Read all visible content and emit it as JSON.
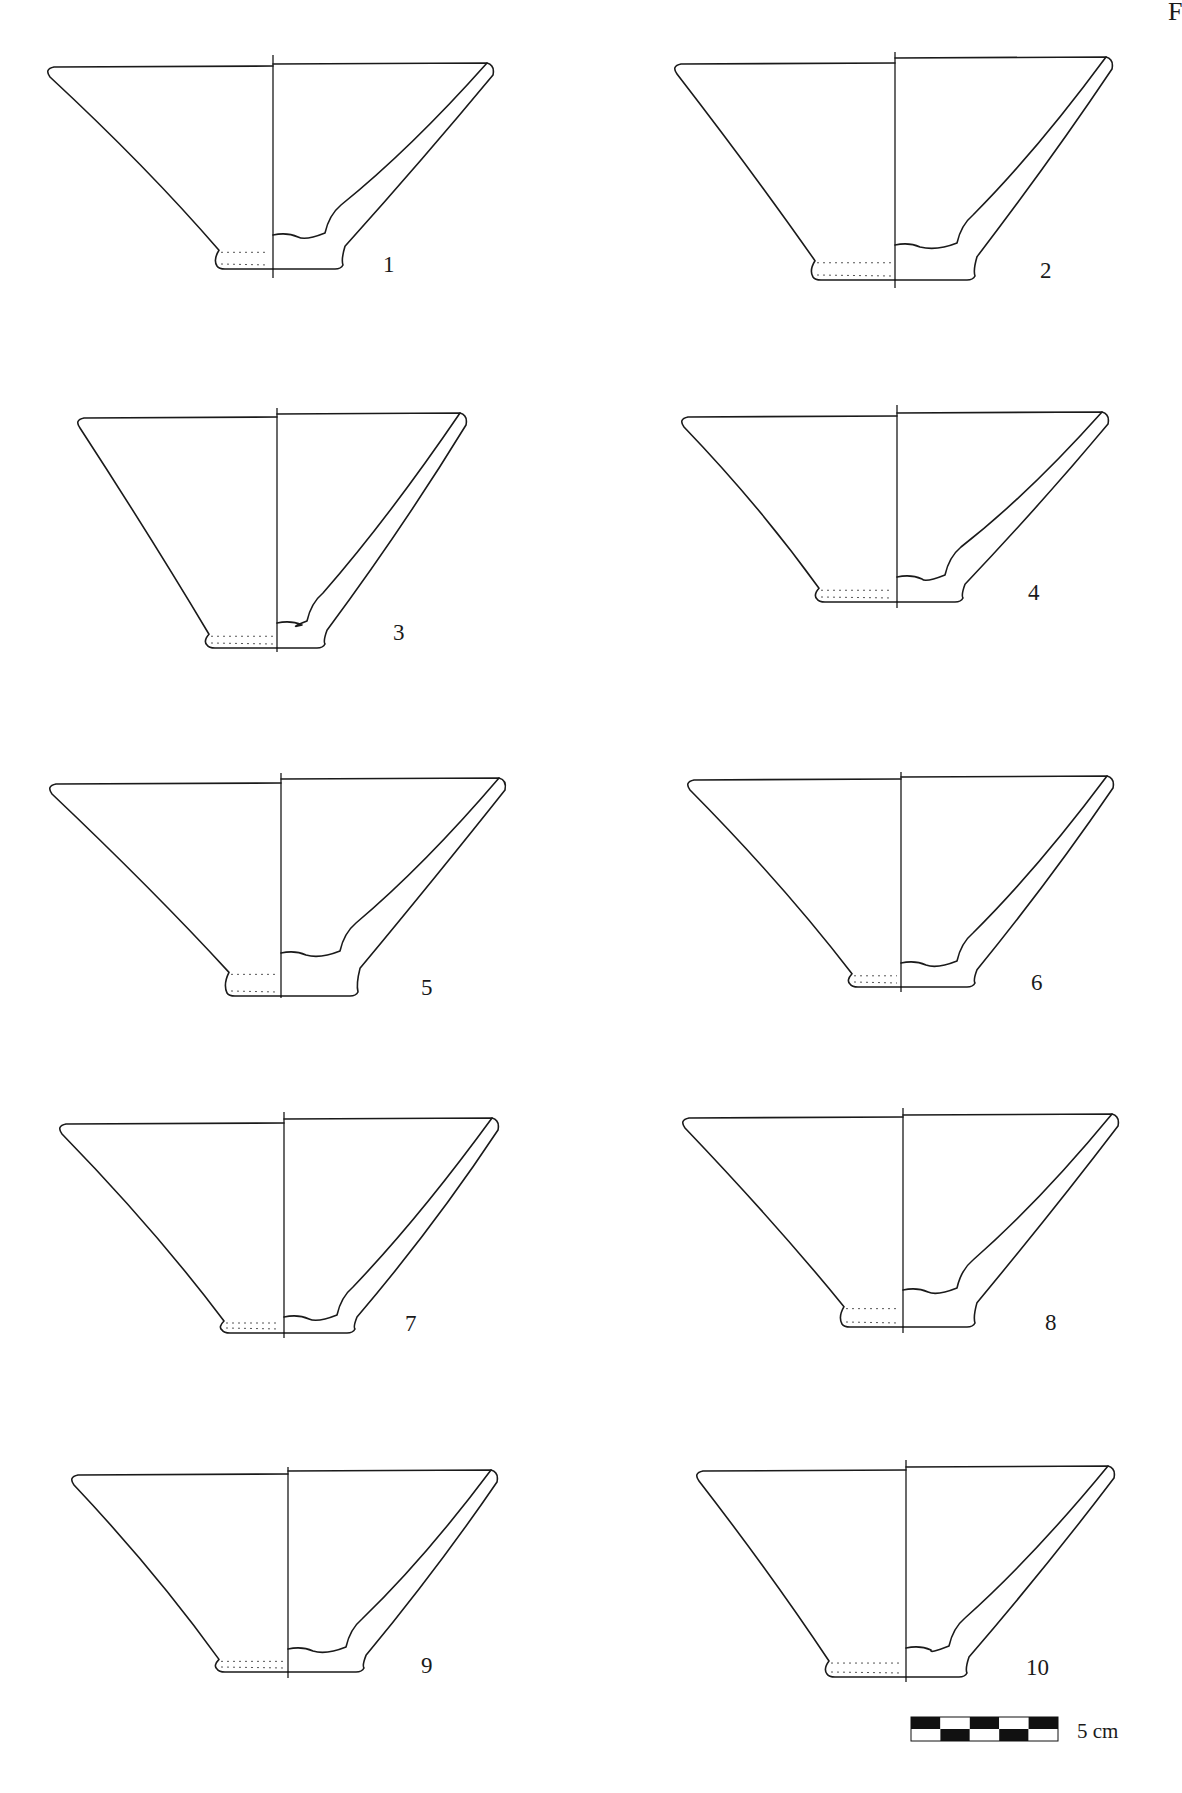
{
  "plate": {
    "page_mark": "F",
    "colors": {
      "ink": "#1a1a1a",
      "paper": "#ffffff"
    }
  },
  "figures": [
    {
      "label": "1",
      "rim_left": [
        48,
        65
      ],
      "rim_right": [
        493,
        63
      ],
      "axis_x": 273,
      "axis_top": 55,
      "axis_bottom": 278,
      "base_y": 269,
      "foot_left": 217,
      "foot_right": 343,
      "interior_y": 235,
      "label_pos": [
        383,
        272
      ]
    },
    {
      "label": "2",
      "rim_left": [
        675,
        62
      ],
      "rim_right": [
        1112,
        57
      ],
      "axis_x": 895,
      "axis_top": 52,
      "axis_bottom": 288,
      "base_y": 280,
      "foot_left": 813,
      "foot_right": 975,
      "interior_y": 245,
      "label_pos": [
        1040,
        278
      ]
    },
    {
      "label": "3",
      "rim_left": [
        78,
        416
      ],
      "rim_right": [
        466,
        413
      ],
      "axis_x": 277,
      "axis_top": 408,
      "axis_bottom": 652,
      "base_y": 648,
      "foot_left": 207,
      "foot_right": 325,
      "interior_y": 623,
      "label_pos": [
        393,
        640
      ]
    },
    {
      "label": "4",
      "rim_left": [
        682,
        415
      ],
      "rim_right": [
        1108,
        412
      ],
      "axis_x": 897,
      "axis_top": 405,
      "axis_bottom": 608,
      "base_y": 602,
      "foot_left": 817,
      "foot_right": 963,
      "interior_y": 577,
      "label_pos": [
        1028,
        600
      ]
    },
    {
      "label": "5",
      "rim_left": [
        50,
        782
      ],
      "rim_right": [
        505,
        778
      ],
      "axis_x": 281,
      "axis_top": 773,
      "axis_bottom": 998,
      "base_y": 996,
      "foot_left": 227,
      "foot_right": 358,
      "interior_y": 953,
      "label_pos": [
        421,
        995
      ]
    },
    {
      "label": "6",
      "rim_left": [
        688,
        778
      ],
      "rim_right": [
        1113,
        776
      ],
      "axis_x": 901,
      "axis_top": 772,
      "axis_bottom": 992,
      "base_y": 987,
      "foot_left": 850,
      "foot_right": 975,
      "interior_y": 963,
      "label_pos": [
        1031,
        990
      ]
    },
    {
      "label": "7",
      "rim_left": [
        60,
        1122
      ],
      "rim_right": [
        498,
        1118
      ],
      "axis_x": 284,
      "axis_top": 1112,
      "axis_bottom": 1338,
      "base_y": 1333,
      "foot_left": 222,
      "foot_right": 355,
      "interior_y": 1317,
      "label_pos": [
        405,
        1331
      ]
    },
    {
      "label": "8",
      "rim_left": [
        683,
        1116
      ],
      "rim_right": [
        1118,
        1114
      ],
      "axis_x": 903,
      "axis_top": 1108,
      "axis_bottom": 1333,
      "base_y": 1327,
      "foot_left": 842,
      "foot_right": 975,
      "interior_y": 1290,
      "label_pos": [
        1045,
        1330
      ]
    },
    {
      "label": "9",
      "rim_left": [
        72,
        1473
      ],
      "rim_right": [
        497,
        1470
      ],
      "axis_x": 288,
      "axis_top": 1467,
      "axis_bottom": 1678,
      "base_y": 1672,
      "foot_left": 217,
      "foot_right": 364,
      "interior_y": 1649,
      "label_pos": [
        421,
        1673
      ]
    },
    {
      "label": "10",
      "rim_left": [
        697,
        1469
      ],
      "rim_right": [
        1114,
        1466
      ],
      "axis_x": 906,
      "axis_top": 1460,
      "axis_bottom": 1682,
      "base_y": 1677,
      "foot_left": 827,
      "foot_right": 967,
      "interior_y": 1648,
      "label_pos": [
        1026,
        1675
      ]
    }
  ],
  "scale_bar": {
    "label": "5 cm",
    "x": 911,
    "y": 1717,
    "width": 147,
    "height": 24,
    "segments": 5,
    "top_row": [
      "black",
      "white",
      "black",
      "white",
      "black"
    ],
    "bottom_row": [
      "white",
      "black",
      "white",
      "black",
      "white"
    ],
    "label_pos": [
      1077,
      1738
    ]
  }
}
